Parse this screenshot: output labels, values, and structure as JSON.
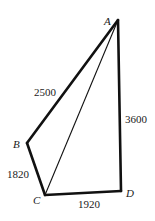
{
  "diagram": {
    "type": "quadrilateral-with-diagonal",
    "vertices": [
      {
        "id": "A",
        "label": "A",
        "x": 118,
        "y": 20
      },
      {
        "id": "B",
        "label": "B",
        "x": 27,
        "y": 143
      },
      {
        "id": "C",
        "label": "C",
        "x": 45,
        "y": 195
      },
      {
        "id": "D",
        "label": "D",
        "x": 121,
        "y": 191
      }
    ],
    "edges": [
      {
        "from": "A",
        "to": "B",
        "label": "2500",
        "bold": true
      },
      {
        "from": "B",
        "to": "C",
        "label": "1820",
        "bold": true
      },
      {
        "from": "C",
        "to": "D",
        "label": "1920",
        "bold": true
      },
      {
        "from": "D",
        "to": "A",
        "label": "3600",
        "bold": true
      },
      {
        "from": "A",
        "to": "C",
        "label": "",
        "bold": false
      }
    ],
    "labels": {
      "A": "A",
      "B": "B",
      "C": "C",
      "D": "D",
      "AB": "2500",
      "BC": "1820",
      "CD": "1920",
      "DA": "3600"
    },
    "colors": {
      "stroke": "#111111",
      "background": "#ffffff"
    }
  }
}
